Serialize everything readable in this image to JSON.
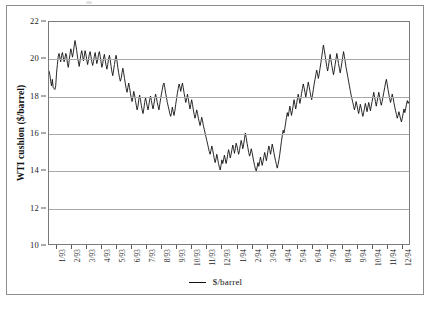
{
  "figure": {
    "y_axis_title": "WTI cushion ($/barrel)",
    "legend_label": "$/barrel"
  },
  "chart_data": {
    "type": "line",
    "title": "",
    "xlabel": "",
    "ylabel": "WTI cushion ($/barrel)",
    "ylim": [
      10,
      22
    ],
    "ytick_labels": [
      "10",
      "12",
      "14",
      "16",
      "18",
      "20",
      "22"
    ],
    "ytick_values": [
      10,
      12,
      14,
      16,
      18,
      20,
      22
    ],
    "grid": true,
    "gridlines_at": [
      12,
      14,
      16,
      18,
      20
    ],
    "legend_position": "bottom-center",
    "legend_entries": [
      "$/barrel"
    ],
    "line_color": "#111111",
    "xtick_labels": [
      "1/93",
      "2/93",
      "3/93",
      "4/93",
      "5/93",
      "6/93",
      "7/93",
      "8/93",
      "9/93",
      "10/93",
      "11/93",
      "12/93",
      "1/94",
      "2/94",
      "3/94",
      "4/94",
      "5/94",
      "6/94",
      "7/94",
      "8/94",
      "9/94",
      "10/94",
      "11/94",
      "12/94"
    ],
    "series": [
      {
        "name": "$/barrel",
        "units": "US dollars per barrel",
        "frequency": "daily",
        "values": [
          19.35,
          19.15,
          18.8,
          18.55,
          18.9,
          18.45,
          18.4,
          18.35,
          18.55,
          19.25,
          19.7,
          20.15,
          20.3,
          20.05,
          19.85,
          20.2,
          20.35,
          20.1,
          19.85,
          20.05,
          20.3,
          20.15,
          19.75,
          19.55,
          19.9,
          20.25,
          20.55,
          20.35,
          20.1,
          20.35,
          20.7,
          21.0,
          20.75,
          20.45,
          20.1,
          19.85,
          19.6,
          19.9,
          20.25,
          20.45,
          20.2,
          19.9,
          20.15,
          20.45,
          20.25,
          19.95,
          19.7,
          19.95,
          20.25,
          20.4,
          20.15,
          19.85,
          19.65,
          19.85,
          20.15,
          20.35,
          20.05,
          19.75,
          19.95,
          20.25,
          20.4,
          20.15,
          19.85,
          19.55,
          19.75,
          20.05,
          20.25,
          19.95,
          19.65,
          19.45,
          19.7,
          20.0,
          20.2,
          19.95,
          19.6,
          19.3,
          19.1,
          19.4,
          19.7,
          20.0,
          20.2,
          19.9,
          19.55,
          19.25,
          19.0,
          18.8,
          18.95,
          19.25,
          19.5,
          19.25,
          18.95,
          18.65,
          18.4,
          18.2,
          18.45,
          18.7,
          18.45,
          18.15,
          17.9,
          17.7,
          17.95,
          18.25,
          18.05,
          17.75,
          17.5,
          17.25,
          17.45,
          17.8,
          18.05,
          17.8,
          17.5,
          17.25,
          17.05,
          17.3,
          17.65,
          17.9,
          17.7,
          17.45,
          17.25,
          17.5,
          17.8,
          18.0,
          17.75,
          17.5,
          17.3,
          17.55,
          17.85,
          18.1,
          17.9,
          17.65,
          17.45,
          17.25,
          17.55,
          17.85,
          18.1,
          18.35,
          18.6,
          18.7,
          18.45,
          18.15,
          17.9,
          17.65,
          17.45,
          17.25,
          17.05,
          16.9,
          17.1,
          17.4,
          17.15,
          16.95,
          17.2,
          17.55,
          17.85,
          18.15,
          18.4,
          18.65,
          18.5,
          18.25,
          18.5,
          18.7,
          18.45,
          18.15,
          17.9,
          17.65,
          17.85,
          18.1,
          17.85,
          17.55,
          17.3,
          17.55,
          17.8,
          17.55,
          17.25,
          17.0,
          16.8,
          17.0,
          17.25,
          17.05,
          16.8,
          16.6,
          16.4,
          16.6,
          16.85,
          16.65,
          16.4,
          16.2,
          16.0,
          15.8,
          15.6,
          15.4,
          15.2,
          15.0,
          14.85,
          15.05,
          15.3,
          15.1,
          14.85,
          14.6,
          14.4,
          14.6,
          14.85,
          14.6,
          14.35,
          14.15,
          14.0,
          14.25,
          14.55,
          14.35,
          14.55,
          14.8,
          14.6,
          14.35,
          14.55,
          14.85,
          15.1,
          14.9,
          14.65,
          14.85,
          15.1,
          15.35,
          15.15,
          14.9,
          15.15,
          15.45,
          15.3,
          15.05,
          14.85,
          15.05,
          15.35,
          15.6,
          15.4,
          15.15,
          15.4,
          15.7,
          16.0,
          15.75,
          15.45,
          15.2,
          14.95,
          14.75,
          14.9,
          15.15,
          14.95,
          14.7,
          14.45,
          14.25,
          14.05,
          13.95,
          14.15,
          14.4,
          14.2,
          14.45,
          14.7,
          14.5,
          14.25,
          14.45,
          14.7,
          14.95,
          14.75,
          14.5,
          14.75,
          15.05,
          15.3,
          15.1,
          14.85,
          15.1,
          15.4,
          15.2,
          14.95,
          14.7,
          14.5,
          14.3,
          14.1,
          14.3,
          14.55,
          14.85,
          15.2,
          15.55,
          15.85,
          16.15,
          16.0,
          16.25,
          16.55,
          16.85,
          17.1,
          16.9,
          17.15,
          17.45,
          17.2,
          16.95,
          17.2,
          17.5,
          17.8,
          17.55,
          17.3,
          17.55,
          17.85,
          18.1,
          17.85,
          17.6,
          17.85,
          18.15,
          18.4,
          18.65,
          18.45,
          18.2,
          17.95,
          18.2,
          18.5,
          18.75,
          18.5,
          18.25,
          18.0,
          17.8,
          18.05,
          18.35,
          18.65,
          18.9,
          19.15,
          19.4,
          19.2,
          18.95,
          19.2,
          19.5,
          19.8,
          20.1,
          20.45,
          20.75,
          20.5,
          20.2,
          19.9,
          19.6,
          19.35,
          19.6,
          19.95,
          20.25,
          19.95,
          19.65,
          19.4,
          19.15,
          19.4,
          19.7,
          20.0,
          20.3,
          20.05,
          19.75,
          19.5,
          19.25,
          19.5,
          19.8,
          20.1,
          20.4,
          20.15,
          19.85,
          19.55,
          19.3,
          19.05,
          18.8,
          18.55,
          18.3,
          18.05,
          17.85,
          17.65,
          17.45,
          17.25,
          17.45,
          17.7,
          17.5,
          17.25,
          17.05,
          17.3,
          17.55,
          17.35,
          17.1,
          16.9,
          17.1,
          17.35,
          17.6,
          17.4,
          17.15,
          17.4,
          17.65,
          17.45,
          17.2,
          17.45,
          17.7,
          17.95,
          18.2,
          17.95,
          17.7,
          17.45,
          17.7,
          17.95,
          18.2,
          17.95,
          17.7,
          17.5,
          17.7,
          17.95,
          18.2,
          18.45,
          18.7,
          18.9,
          18.65,
          18.35,
          18.1,
          17.85,
          17.65,
          17.85,
          18.1,
          17.9,
          17.65,
          17.4,
          17.2,
          17.0,
          16.8,
          16.95,
          17.15,
          16.95,
          16.75,
          16.6,
          16.8,
          17.05,
          17.3,
          17.1,
          17.3,
          17.55,
          17.75,
          17.6,
          17.7
        ]
      }
    ]
  }
}
